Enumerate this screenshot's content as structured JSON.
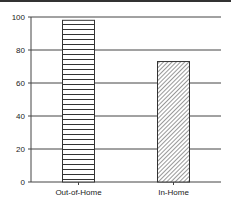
{
  "chart_data": {
    "type": "bar",
    "title": "",
    "xlabel": "",
    "ylabel": "",
    "categories": [
      "Out-of-Home",
      "In-Home"
    ],
    "values": [
      98,
      73
    ],
    "patterns": [
      "horizontal-lines",
      "diagonal-hatch"
    ],
    "ylim": [
      0,
      100
    ],
    "yticks": [
      0,
      20,
      40,
      60,
      80,
      100
    ],
    "grid": true,
    "legend": "none"
  }
}
